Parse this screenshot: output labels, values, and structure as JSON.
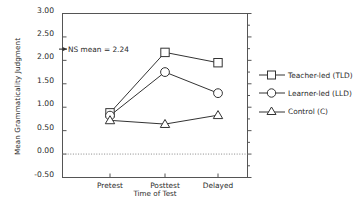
{
  "chart_data": {
    "type": "line",
    "title": "",
    "xlabel": "Time of Test",
    "ylabel": "Mean Grammaticality Judgment",
    "categories": [
      "Pretest",
      "Posttest",
      "Delayed"
    ],
    "ylim": [
      -0.5,
      3.0
    ],
    "ytick_labels": [
      "3.00",
      "2.50",
      "2.00",
      "1.50",
      "1.00",
      "0.50",
      "0.00",
      "-0.50"
    ],
    "ytick_values": [
      3.0,
      2.5,
      2.0,
      1.5,
      1.0,
      0.5,
      0.0,
      -0.5
    ],
    "grid": false,
    "legend_position": "right",
    "reference_lines": [
      {
        "name": "zero-line",
        "value": 0.0,
        "style": "dotted"
      }
    ],
    "annotations": [
      {
        "name": "ns-mean",
        "text": "NS mean = 2.24",
        "value": 2.24,
        "marker": "arrow"
      }
    ],
    "series": [
      {
        "name": "Teacher-led (TLD)",
        "marker": "square",
        "values": [
          0.88,
          2.17,
          1.95
        ]
      },
      {
        "name": "Learner-led (LLD)",
        "marker": "circle",
        "values": [
          0.82,
          1.75,
          1.3
        ]
      },
      {
        "name": "Control (C)",
        "marker": "triangle",
        "values": [
          0.72,
          0.64,
          0.83
        ]
      }
    ]
  },
  "axes": {
    "y_title": "Mean Grammaticality Judgment",
    "x_title": "Time of Test",
    "y_ticks": [
      {
        "label": "3.00",
        "top": 9.5
      },
      {
        "label": "2.50",
        "top": 33.0
      },
      {
        "label": "2.00",
        "top": 56.4
      },
      {
        "label": "1.50",
        "top": 79.9
      },
      {
        "label": "1.00",
        "top": 103.3
      },
      {
        "label": "0.50",
        "top": 126.8
      },
      {
        "label": "0.00",
        "top": 150.2
      },
      {
        "label": "-0.50",
        "top": 173.7
      }
    ],
    "x_ticks": [
      {
        "label": "Pretest",
        "left": 80
      },
      {
        "label": "Posttest",
        "left": 135
      },
      {
        "label": "Delayed",
        "left": 188
      }
    ]
  },
  "annotation": {
    "ns_mean_text": "NS mean = 2.24"
  },
  "legend": {
    "items": [
      {
        "label": "Teacher-led (TLD)",
        "marker": "square"
      },
      {
        "label": "Learner-led (LLD)",
        "marker": "circle"
      },
      {
        "label": "Control (C)",
        "marker": "triangle"
      }
    ]
  }
}
